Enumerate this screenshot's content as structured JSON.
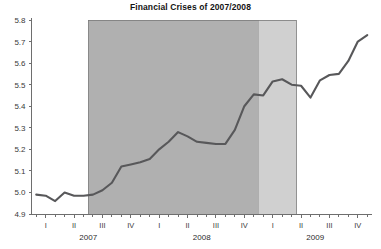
{
  "chart_data": {
    "type": "line",
    "title": "Financial Crises of 2007/2008",
    "xlabel": "",
    "ylabel": "",
    "ylim": [
      4.9,
      5.8
    ],
    "ytick_labels": [
      "4.9",
      "5.0",
      "5.1",
      "5.2",
      "5.3",
      "5.4",
      "5.5",
      "5.6",
      "5.7",
      "5.8"
    ],
    "ytick_values": [
      4.9,
      5.0,
      5.1,
      5.2,
      5.3,
      5.4,
      5.5,
      5.6,
      5.7,
      5.8
    ],
    "grid": false,
    "legend": "none",
    "xtick_labels": [
      "I",
      "II",
      "III",
      "IV",
      "I",
      "II",
      "III",
      "IV",
      "I",
      "II",
      "III",
      "IV"
    ],
    "year_labels": [
      {
        "text": "2007",
        "quarter_index": 1.5
      },
      {
        "text": "2008",
        "quarter_index": 5.5
      },
      {
        "text": "2009",
        "quarter_index": 9.5
      }
    ],
    "x_months": 36,
    "x_month_start": 1,
    "shaded_regions": [
      {
        "name": "crisis-band-dark",
        "start_month": 7,
        "end_month": 25,
        "color": "#b0b0b0",
        "label": "2007 Q3 - 2008 Q3"
      },
      {
        "name": "crisis-band-light",
        "start_month": 25,
        "end_month": 29,
        "color": "#d0d0d0",
        "label": "2008 Q4"
      }
    ],
    "series": [
      {
        "name": "index",
        "color": "#58585a",
        "x": [
          1,
          2,
          3,
          4,
          5,
          6,
          7,
          8,
          9,
          10,
          11,
          12,
          13,
          14,
          15,
          16,
          17,
          18,
          19,
          20,
          21,
          22,
          23,
          24,
          25,
          26,
          27,
          28,
          29,
          30,
          31,
          32,
          33,
          34,
          35,
          36
        ],
        "values": [
          4.99,
          4.985,
          4.96,
          5.0,
          4.985,
          4.985,
          4.99,
          5.01,
          5.045,
          5.12,
          5.13,
          5.14,
          5.155,
          5.2,
          5.235,
          5.28,
          5.26,
          5.235,
          5.23,
          5.225,
          5.225,
          5.29,
          5.4,
          5.455,
          5.45,
          5.515,
          5.525,
          5.5,
          5.495,
          5.44,
          5.52,
          5.545,
          5.55,
          5.61,
          5.7,
          5.73
        ]
      }
    ]
  }
}
